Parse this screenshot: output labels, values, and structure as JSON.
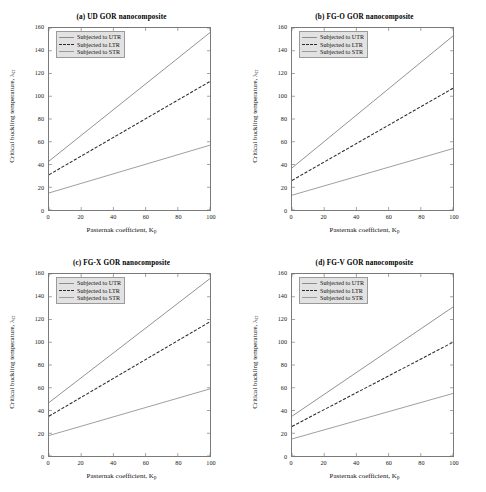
{
  "figure": {
    "x_ticks": [
      0,
      20,
      40,
      60,
      80,
      100
    ],
    "y_ticks": [
      0,
      20,
      40,
      60,
      80,
      100,
      120,
      140,
      160
    ],
    "xlabel_main": "Pasternak coefficient, K",
    "xlabel_sub": "p",
    "ylabel_main": "Critical buckling temperature, λ",
    "ylabel_sub": "cr",
    "legend": [
      "Subjected to UTR",
      "Subjected to LTR",
      "Subjected to STR"
    ],
    "colors": {
      "utr": "#8c8c8c",
      "ltr": "#2b2b2b",
      "str": "#9a9a9a",
      "axis": "#7a7a7a",
      "legend_bg": "#e2e2e2"
    }
  },
  "chart_data": [
    {
      "type": "line",
      "title": "(a) UD GOR nanocomposite",
      "xlabel": "Pasternak coefficient, K_p",
      "ylabel": "Critical buckling temperature, λ_cr",
      "xlim": [
        0,
        100
      ],
      "ylim": [
        0,
        160
      ],
      "grid": false,
      "legend_position": "upper left",
      "x": [
        0,
        100
      ],
      "series": [
        {
          "name": "Subjected to UTR",
          "values": [
            43,
            156
          ],
          "style": "solid",
          "color": "#8c8c8c"
        },
        {
          "name": "Subjected to LTR",
          "values": [
            31,
            113
          ],
          "style": "dashed",
          "color": "#2b2b2b"
        },
        {
          "name": "Subjected to STR",
          "values": [
            15,
            57
          ],
          "style": "solid",
          "color": "#9a9a9a"
        }
      ]
    },
    {
      "type": "line",
      "title": "(b) FG-O GOR nanocomposite",
      "xlabel": "Pasternak coefficient, K_p",
      "ylabel": "Critical buckling temperature, λ_cr",
      "xlim": [
        0,
        100
      ],
      "ylim": [
        0,
        160
      ],
      "grid": false,
      "legend_position": "upper left",
      "x": [
        0,
        100
      ],
      "series": [
        {
          "name": "Subjected to UTR",
          "values": [
            37,
            153
          ],
          "style": "solid",
          "color": "#8c8c8c"
        },
        {
          "name": "Subjected to LTR",
          "values": [
            26,
            107
          ],
          "style": "dashed",
          "color": "#2b2b2b"
        },
        {
          "name": "Subjected to STR",
          "values": [
            13,
            54
          ],
          "style": "solid",
          "color": "#9a9a9a"
        }
      ]
    },
    {
      "type": "line",
      "title": "(c) FG-X GOR nanocomposite",
      "xlabel": "Pasternak coefficient, K_p",
      "ylabel": "Critical buckling temperature, λ_cr",
      "xlim": [
        0,
        100
      ],
      "ylim": [
        0,
        160
      ],
      "grid": false,
      "legend_position": "upper left",
      "x": [
        0,
        100
      ],
      "series": [
        {
          "name": "Subjected to UTR",
          "values": [
            47,
            156
          ],
          "style": "solid",
          "color": "#8c8c8c"
        },
        {
          "name": "Subjected to LTR",
          "values": [
            35,
            118
          ],
          "style": "dashed",
          "color": "#2b2b2b"
        },
        {
          "name": "Subjected to STR",
          "values": [
            18,
            59
          ],
          "style": "solid",
          "color": "#9a9a9a"
        }
      ]
    },
    {
      "type": "line",
      "title": "(d) FG-V GOR nanocomposite",
      "xlabel": "Pasternak coefficient, K_p",
      "ylabel": "Critical buckling temperature, λ_cr",
      "xlim": [
        0,
        100
      ],
      "ylim": [
        0,
        160
      ],
      "grid": false,
      "legend_position": "upper left",
      "x": [
        0,
        100
      ],
      "series": [
        {
          "name": "Subjected to UTR",
          "values": [
            35,
            131
          ],
          "style": "solid",
          "color": "#8c8c8c"
        },
        {
          "name": "Subjected to LTR",
          "values": [
            26,
            100
          ],
          "style": "dashed",
          "color": "#2b2b2b"
        },
        {
          "name": "Subjected to STR",
          "values": [
            15,
            55
          ],
          "style": "solid",
          "color": "#9a9a9a"
        }
      ]
    }
  ]
}
